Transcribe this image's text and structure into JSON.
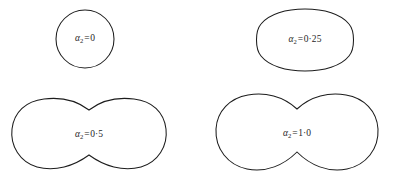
{
  "figure": {
    "type": "shape-series",
    "background_color": "#ffffff",
    "stroke_color": "#1c1c1c",
    "fill_color": "#ffffff",
    "symbol": "α",
    "subscript": "2",
    "equals": "=",
    "panels": [
      {
        "id": "panel-alpha-0",
        "name": "circle",
        "symbol": "α",
        "subscript": "2",
        "equals": "=",
        "value": "0",
        "label": "α₂ = 0",
        "shape_kind": "circle",
        "waist_factor": 0.0,
        "path": "M 33 2 C 49.0 2 62 15.0 62 31.0 C 62 47.0 49.0 60 33 60 C 17.0 60 4 47.0 4 31.0 C 4 15.0 17.0 2 33 2 Z"
      },
      {
        "id": "panel-alpha-025",
        "name": "rounded-oval",
        "symbol": "α",
        "subscript": "2",
        "equals": "=",
        "value": "0·25",
        "label": "α₂ = 0·25",
        "shape_kind": "oval",
        "waist_factor": 0.08,
        "path": "M 57 3 C 76 3 93 8 101 18 C 107 25 107 43 101 50 C 93 60 76 65 57 65 C 38 65 21 60 13 50 C 7 43 7 25 13 18 C 21 8 38 3 57 3 Z"
      },
      {
        "id": "panel-alpha-05",
        "name": "dumbbell-shallow",
        "symbol": "α",
        "subscript": "2",
        "equals": "=",
        "value": "0·5",
        "label": "α₂ = 0·5",
        "shape_kind": "dumbbell",
        "waist_factor": 0.34,
        "path": "M 83 14 C 96 4 112 1 128 3 C 146 5 158 16 160 33 C 162 50 152 66 135 71 C 117 76 98 70 83 59 C 68 70 49 76 31 71 C 14 66 4 50 6 33 C 8 16 20 5 38 3 C 54 1 70 4 83 14 Z"
      },
      {
        "id": "panel-alpha-10",
        "name": "dumbbell-deep",
        "symbol": "α",
        "subscript": "2",
        "equals": "=",
        "value": "1·0",
        "label": "α₂ = 1·0",
        "shape_kind": "dumbbell",
        "waist_factor": 0.5,
        "path": "M 85 17 C 99 4 117 0 134 3 C 152 6 165 19 166 37 C 167 57 154 73 135 77 C 116 81 98 73 85 60 C 72 73 54 81 35 77 C 16 73 3 57 4 37 C 5 19 18 6 36 3 C 53 0 71 4 85 17 Z"
      }
    ]
  },
  "chart_data": {
    "type": "line",
    "title": "",
    "xlabel": "",
    "ylabel": "",
    "series": [
      {
        "name": "α₂ = 0",
        "parameter": 0,
        "waist_depth": 0.0,
        "width_px": 58,
        "height_px": 58
      },
      {
        "name": "α₂ = 0·25",
        "parameter": 0.25,
        "waist_depth": 0.08,
        "width_px": 100,
        "height_px": 62
      },
      {
        "name": "α₂ = 0·5",
        "parameter": 0.5,
        "waist_depth": 0.34,
        "width_px": 156,
        "height_px": 75
      },
      {
        "name": "α₂ = 1·0",
        "parameter": 1.0,
        "waist_depth": 0.5,
        "width_px": 163,
        "height_px": 81
      }
    ]
  }
}
